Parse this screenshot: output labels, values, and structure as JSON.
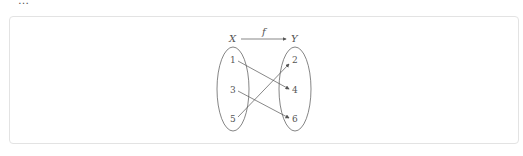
{
  "header": {
    "partial_text": "…"
  },
  "diagram": {
    "domain_label": "X",
    "codomain_label": "Y",
    "function_label": "f",
    "domain_elements": [
      "1",
      "3",
      "5"
    ],
    "codomain_elements": [
      "2",
      "4",
      "6"
    ],
    "mappings": [
      {
        "from": "1",
        "to": "4"
      },
      {
        "from": "3",
        "to": "6"
      },
      {
        "from": "5",
        "to": "2"
      }
    ],
    "line_color": "#555555"
  }
}
